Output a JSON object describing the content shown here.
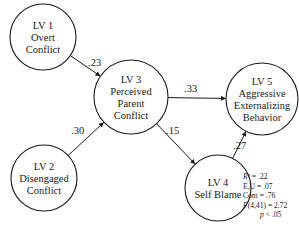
{
  "diagram": {
    "nodes": [
      {
        "id": "LV1",
        "cx": 43,
        "cy": 37,
        "r": 33,
        "lines": [
          "LV 1",
          "Overt",
          "Conflict"
        ]
      },
      {
        "id": "LV2",
        "cx": 44,
        "cy": 178,
        "r": 33,
        "lines": [
          "LV 2",
          "Disengaged",
          "Conflict"
        ]
      },
      {
        "id": "LV3",
        "cx": 131,
        "cy": 97,
        "r": 37,
        "lines": [
          "LV 3",
          "Perceived",
          "Parent",
          "Conflict"
        ]
      },
      {
        "id": "LV4",
        "cx": 218,
        "cy": 188,
        "r": 33,
        "lines": [
          "LV 4",
          "Self Blame"
        ]
      },
      {
        "id": "LV5",
        "cx": 262,
        "cy": 99,
        "r": 36,
        "lines": [
          "LV 5",
          "Aggressive",
          "Externalizing",
          "Behavior"
        ]
      }
    ],
    "paths": [
      {
        "from": "LV1",
        "to": "LV3",
        "coef": ".23",
        "label_x": 88,
        "label_y": 66
      },
      {
        "from": "LV2",
        "to": "LV3",
        "coef": ".30",
        "label_x": 71,
        "label_y": 134
      },
      {
        "from": "LV3",
        "to": "LV5",
        "coef": ".33",
        "label_x": 184,
        "label_y": 92
      },
      {
        "from": "LV3",
        "to": "LV4",
        "coef": ".15",
        "label_x": 166,
        "label_y": 134
      },
      {
        "from": "LV4",
        "to": "LV5",
        "coef": ".27",
        "label_x": 233,
        "label_y": 149
      }
    ],
    "stats": [
      {
        "text": "R² = .22",
        "italic_prefix": "R"
      },
      {
        "text": "E,U = .07"
      },
      {
        "text": "Com = .76"
      },
      {
        "text": "F(4,41) = 2.72",
        "italic_prefix": "F"
      },
      {
        "text": "p < .05",
        "italic_prefix": "p",
        "indent": true
      }
    ]
  }
}
